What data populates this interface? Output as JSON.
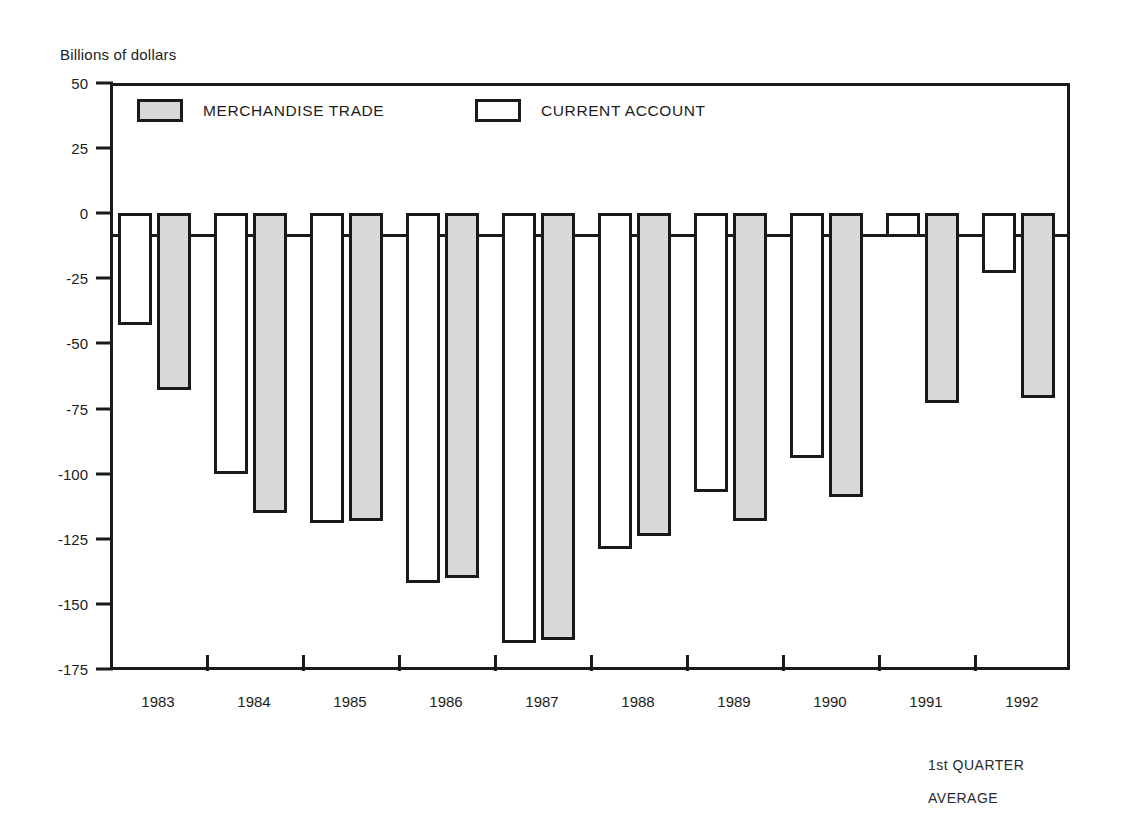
{
  "chart_data": {
    "type": "bar",
    "title": "",
    "ylabel": "Billions of dollars",
    "xlabel": "",
    "categories": [
      "1983",
      "1984",
      "1985",
      "1986",
      "1987",
      "1988",
      "1989",
      "1990",
      "1991",
      "1992"
    ],
    "series": [
      {
        "name": "CURRENT ACCOUNT",
        "fill": "#ffffff",
        "values": [
          -43,
          -100,
          -119,
          -142,
          -165,
          -129,
          -107,
          -94,
          -9,
          -23
        ]
      },
      {
        "name": "MERCHANDISE TRADE",
        "fill": "#d8d8d8",
        "values": [
          -68,
          -115,
          -118,
          -140,
          -164,
          -124,
          -118,
          -109,
          -73,
          -71
        ]
      }
    ],
    "ylim": [
      -175,
      50
    ],
    "yticks": [
      50,
      25,
      0,
      -25,
      -50,
      -75,
      -100,
      -125,
      -150,
      -175
    ],
    "ytick_labels": [
      "50",
      "25",
      "0",
      "-25",
      "-50",
      "-75",
      "-100",
      "-125",
      "-150",
      "-175"
    ],
    "grid": false,
    "legend_position": "top-inside",
    "annotations": [
      "1st QUARTER",
      "AVERAGE"
    ]
  },
  "legend": {
    "trade_label": "MERCHANDISE TRADE",
    "current_label": "CURRENT ACCOUNT"
  },
  "axes": {
    "y_title": "Billions of dollars"
  },
  "footnote": {
    "line1": "1st QUARTER",
    "line2": "AVERAGE"
  }
}
